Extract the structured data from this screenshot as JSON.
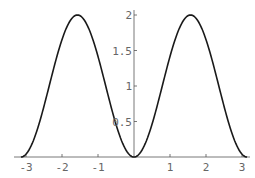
{
  "chart_data": {
    "type": "line",
    "title": "",
    "xlabel": "",
    "ylabel": "",
    "function": "2 sin^2(x)",
    "xlim": [
      -3.1416,
      3.1416
    ],
    "ylim": [
      0,
      2
    ],
    "grid": false,
    "legend": null,
    "x_ticks": [
      -3,
      -2,
      -1,
      1,
      2,
      3
    ],
    "x_tick_labels": [
      "-3",
      "-2",
      "-1",
      "1",
      "2",
      "3"
    ],
    "y_ticks": [
      0.5,
      1,
      1.5,
      2
    ],
    "y_tick_labels": [
      "0.5",
      "1",
      "1.5",
      "2"
    ],
    "series": [
      {
        "name": "curve",
        "x": [
          -3.14,
          -2.75,
          -2.36,
          -1.96,
          -1.57,
          -1.18,
          -0.79,
          -0.39,
          0,
          0.39,
          0.79,
          1.18,
          1.57,
          1.96,
          2.36,
          2.75,
          3.14
        ],
        "values": [
          0,
          0.29,
          1.0,
          1.71,
          2.0,
          1.71,
          1.0,
          0.29,
          0,
          0.29,
          1.0,
          1.71,
          2.0,
          1.71,
          1.0,
          0.29,
          0
        ]
      }
    ],
    "line_color": "#1a1a1a",
    "axis_color": "#555555"
  }
}
